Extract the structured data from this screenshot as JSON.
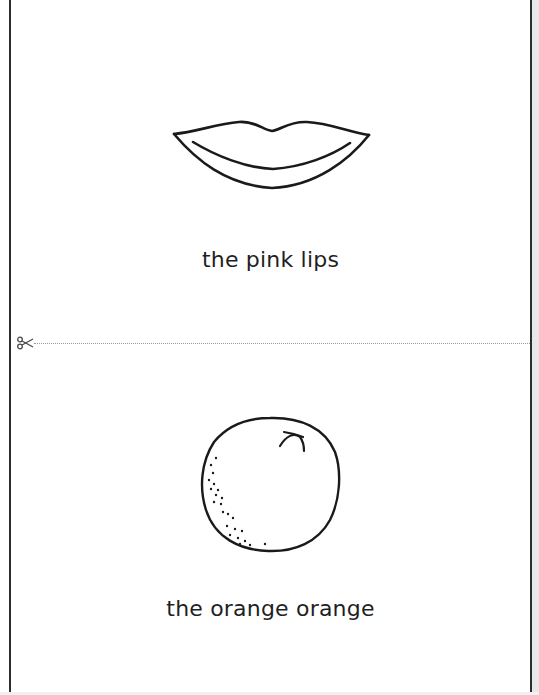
{
  "worksheet": {
    "cards": [
      {
        "caption": "the pink lips",
        "illustration": "lips-icon"
      },
      {
        "caption": "the orange orange",
        "illustration": "orange-fruit-icon"
      }
    ],
    "cut_line": {
      "icon": "scissors-icon",
      "style": "dotted"
    },
    "colors": {
      "ink": "#1f1f1f",
      "border": "#2e2e2e",
      "cut_line": "#9a9a9a",
      "background": "#ffffff"
    }
  }
}
